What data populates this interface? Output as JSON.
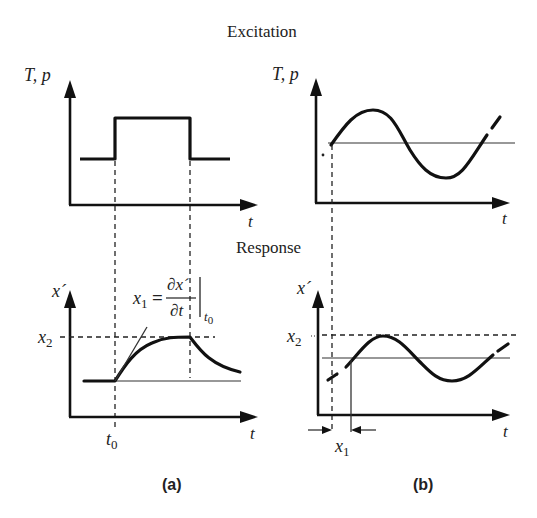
{
  "figure": {
    "header_top": "Excitation",
    "header_middle": "Response",
    "panel_a": {
      "caption": "(a)",
      "excitation": {
        "y_label": "T, p",
        "x_label": "t",
        "signal": "step pulse"
      },
      "response": {
        "y_label": "x´",
        "x_label": "t",
        "level_label_main": "x",
        "level_label_sub": "2",
        "time_label_main": "t",
        "time_label_sub": "0",
        "formula": {
          "lhs_main": "x",
          "lhs_sub": "1",
          "equals": "=",
          "numerator": "∂x´",
          "denominator": "∂t",
          "eval_sub": "t0"
        }
      }
    },
    "panel_b": {
      "caption": "(b)",
      "excitation": {
        "y_label": "T, p",
        "x_label": "t",
        "signal": "sinusoid"
      },
      "response": {
        "y_label": "x´",
        "x_label": "t",
        "level_label_main": "x",
        "level_label_sub": "2",
        "lag_label_main": "x",
        "lag_label_sub": "1"
      }
    }
  },
  "colors": {
    "ink": "#111111",
    "background": "#ffffff"
  }
}
